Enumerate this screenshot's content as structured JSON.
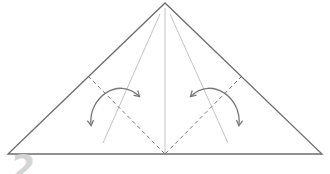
{
  "diagram": {
    "type": "origami-fold-instruction",
    "step_number": "2",
    "colors": {
      "outline": "#6e6e6e",
      "crease": "#c4c4c4",
      "valley_fold": "#7a7a7a",
      "arrow": "#777777",
      "step_number": "#d4d4d4",
      "background": "#ffffff"
    },
    "shape": {
      "name": "triangle",
      "apex": [
        165,
        3
      ],
      "base_left": [
        8,
        154
      ],
      "base_right": [
        322,
        154
      ]
    },
    "creases": [
      {
        "name": "center-crease",
        "from": [
          165,
          8
        ],
        "to": [
          165,
          154
        ]
      },
      {
        "name": "left-crease",
        "from": [
          160,
          14
        ],
        "to": [
          103,
          143
        ]
      },
      {
        "name": "right-crease",
        "from": [
          170,
          14
        ],
        "to": [
          228,
          143
        ]
      }
    ],
    "fold_lines": [
      {
        "name": "left-valley-fold",
        "from": [
          88,
          76
        ],
        "to": [
          165,
          154
        ],
        "style": "dashed"
      },
      {
        "name": "right-valley-fold",
        "from": [
          242,
          76
        ],
        "to": [
          165,
          154
        ],
        "style": "dashed"
      }
    ],
    "arrows": [
      {
        "name": "left-fold-unfold-arrow",
        "path": "M91 125 C 88 98, 118 76, 139 96",
        "heads": "both"
      },
      {
        "name": "right-fold-unfold-arrow",
        "path": "M191 96 C 212 76, 242 98, 239 125",
        "heads": "both"
      }
    ]
  }
}
